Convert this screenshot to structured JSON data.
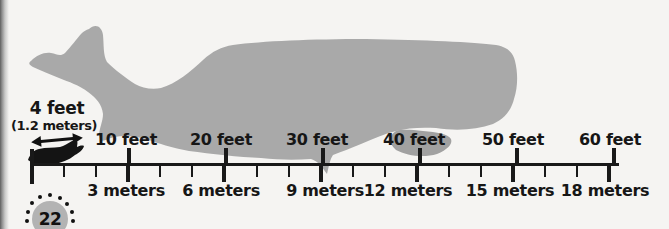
{
  "page_number": "22",
  "colors": {
    "background": "#f5f4f2",
    "whale_gray": "#a9a9a9",
    "flipper_gray": "#a1a1a1",
    "ink": "#191919",
    "badge_gray": "#b3b3b3",
    "page_edge_shadow": "#5f5f5f"
  },
  "callout": {
    "feet": "4 feet",
    "meters": "(1.2 meters)"
  },
  "ruler": {
    "feet_labels": [
      "10 feet",
      "20 feet",
      "30 feet",
      "40 feet",
      "50 feet",
      "60 feet"
    ],
    "meter_labels": [
      "3 meters",
      "6 meters",
      "9 meters",
      "12 meters",
      "15 meters",
      "18 meters"
    ],
    "feet_tick_values": [
      10,
      20,
      30,
      40,
      50,
      60
    ],
    "meter_major_tick_values": [
      3,
      6,
      9,
      12,
      15,
      18
    ]
  },
  "icons": {
    "whale": "sperm-whale-silhouette",
    "small_animal": "small-whale-icon",
    "arrow": "double-headed-arrow-icon"
  }
}
